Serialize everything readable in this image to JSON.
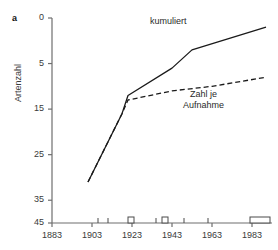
{
  "figure": {
    "panel_letter": "a",
    "ylabel": "Artenzahl"
  },
  "axes": {
    "y_ticks": [
      "45",
      "35",
      "25",
      "15",
      "5",
      "0"
    ],
    "x_ticks": [
      "1883",
      "1903",
      "1923",
      "1943",
      "1963",
      "1983"
    ]
  },
  "labels": {
    "kumuliert": "kumuliert",
    "zahl_je_line1": "Zahl je",
    "zahl_je_line2": "Aufnahme"
  },
  "colors": {
    "line": "#1a1a1a",
    "axis": "#6e6e6e",
    "text": "#3a3a3a",
    "background": "#ffffff"
  },
  "chart_data": {
    "type": "line",
    "title": "",
    "xlabel": "",
    "ylabel": "Artenzahl",
    "xlim": [
      1883,
      1993
    ],
    "ylim": [
      0,
      45
    ],
    "y_ticks": [
      0,
      5,
      15,
      25,
      35,
      45
    ],
    "x_ticks": [
      1883,
      1903,
      1923,
      1943,
      1963,
      1983
    ],
    "grid": false,
    "legend": "inline-annotations",
    "series": [
      {
        "name": "kumuliert",
        "style": "solid",
        "x": [
          1901,
          1918,
          1921,
          1943,
          1953,
          1990
        ],
        "values": [
          9,
          24,
          28,
          34,
          38,
          43
        ]
      },
      {
        "name": "Zahl je Aufnahme",
        "style": "dashed",
        "x": [
          1901,
          1918,
          1921,
          1943,
          1963,
          1990
        ],
        "values": [
          9,
          24,
          27,
          29,
          30,
          32
        ]
      }
    ],
    "sampling_markers": {
      "description": "survey-period marks drawn on the baseline (y=0)",
      "ticks": [
        1906,
        1911,
        1935,
        1949,
        1961
      ],
      "boxes": [
        {
          "start": 1921,
          "end": 1924
        },
        {
          "start": 1938,
          "end": 1941
        },
        {
          "start": 1982,
          "end": 1992
        }
      ]
    }
  }
}
